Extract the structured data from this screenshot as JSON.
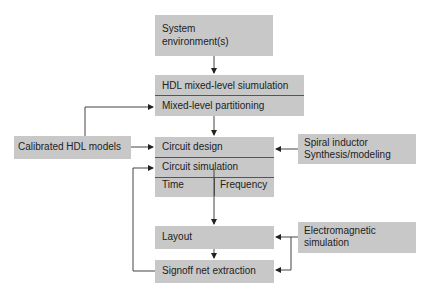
{
  "diagram": {
    "system_env": "System\nenvironment(s)",
    "system_env_l1": "System",
    "system_env_l2": "environment(s)",
    "hdl_sim": "HDL mixed-level siumulation",
    "partitioning": "Mixed-level partitioning",
    "calibrated": "Calibrated HDL models",
    "circuit_design": "Circuit design",
    "circuit_sim": "Circuit simulation",
    "time_l1": "Time",
    "time_l2": "domain",
    "freq_l1": "Frequency",
    "freq_l2": "domain",
    "spiral_l1": "Spiral inductor",
    "spiral_l2": "Synthesis/modeling",
    "layout": "Layout",
    "em_l1": "Electromagnetic",
    "em_l2": "simulation",
    "signoff": "Signoff net extraction"
  },
  "colors": {
    "box_fill": "#c8c8c8",
    "line": "#444444"
  }
}
